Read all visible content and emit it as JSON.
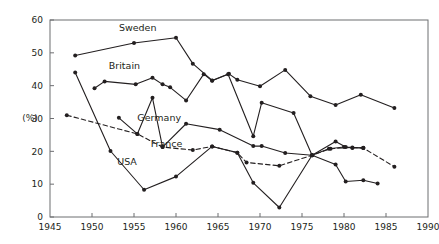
{
  "chart_data": {
    "type": "line",
    "title": "",
    "xlabel": "",
    "ylabel": "(%)",
    "xlim": [
      1945,
      1990
    ],
    "ylim": [
      0,
      60
    ],
    "xticks": [
      1945,
      1950,
      1955,
      1960,
      1965,
      1970,
      1975,
      1980,
      1985,
      1990
    ],
    "yticks": [
      0,
      10,
      20,
      30,
      40,
      50,
      60
    ],
    "grid": false,
    "legend": "inline-labels",
    "series": [
      {
        "name": "Sweden",
        "style": "solid",
        "label_x": 1953.2,
        "label_y": 56.5,
        "points": [
          [
            1948,
            49.2
          ],
          [
            1955,
            53.0
          ],
          [
            1960,
            54.6
          ],
          [
            1962,
            46.7
          ],
          [
            1964.3,
            41.6
          ],
          [
            1966.3,
            43.6
          ],
          [
            1967.3,
            41.8
          ],
          [
            1970,
            39.8
          ],
          [
            1973,
            44.8
          ],
          [
            1976,
            36.8
          ],
          [
            1979,
            34.1
          ],
          [
            1982,
            37.2
          ],
          [
            1986,
            33.2
          ]
        ]
      },
      {
        "name": "Britain",
        "style": "solid",
        "label_x": 1952.0,
        "label_y": 45.0,
        "points": [
          [
            1950.3,
            39.2
          ],
          [
            1951.5,
            41.3
          ],
          [
            1955.2,
            40.4
          ],
          [
            1957.2,
            42.4
          ],
          [
            1958.4,
            40.4
          ],
          [
            1959.3,
            39.5
          ],
          [
            1961.2,
            35.5
          ],
          [
            1963.3,
            43.5
          ],
          [
            1964.3,
            41.5
          ],
          [
            1966.2,
            43.5
          ],
          [
            1969.2,
            24.6
          ],
          [
            1970.2,
            34.8
          ],
          [
            1974,
            31.7
          ],
          [
            1976.2,
            18.8
          ],
          [
            1978.2,
            20.8
          ],
          [
            1980,
            21.3
          ],
          [
            1981,
            21.0
          ],
          [
            1982.3,
            21.1
          ]
        ]
      },
      {
        "name": "Germany",
        "style": "solid",
        "label_x": 1955.4,
        "label_y": 29.2,
        "points": [
          [
            1953.2,
            30.2
          ],
          [
            1955.4,
            25.3
          ],
          [
            1957.2,
            36.3
          ],
          [
            1958.4,
            21.3
          ],
          [
            1961.2,
            28.4
          ],
          [
            1965.2,
            26.6
          ],
          [
            1969.2,
            21.6
          ],
          [
            1970.2,
            21.6
          ],
          [
            1973,
            19.5
          ],
          [
            1976.2,
            18.8
          ],
          [
            1979,
            23.0
          ],
          [
            1980.2,
            21.3
          ],
          [
            1982.3,
            21.0
          ]
        ]
      },
      {
        "name": "France",
        "style": "dashed",
        "label_x": 1957.0,
        "label_y": 21.3,
        "points": [
          [
            1947,
            31.0
          ],
          [
            1955.4,
            25.3
          ],
          [
            1958.4,
            21.3
          ],
          [
            1962,
            20.4
          ],
          [
            1964.3,
            21.5
          ],
          [
            1967.3,
            19.6
          ],
          [
            1968.4,
            16.6
          ],
          [
            1972.3,
            15.6
          ],
          [
            1976.2,
            18.8
          ],
          [
            1978.4,
            20.8
          ],
          [
            1981,
            21.2
          ],
          [
            1982.3,
            21.0
          ],
          [
            1986,
            15.3
          ]
        ]
      },
      {
        "name": "USA",
        "style": "solid",
        "label_x": 1953.0,
        "label_y": 15.8,
        "points": [
          [
            1948,
            44.0
          ],
          [
            1952.2,
            20.1
          ],
          [
            1956.2,
            8.3
          ],
          [
            1960,
            12.3
          ],
          [
            1964.3,
            21.5
          ],
          [
            1967.3,
            19.6
          ],
          [
            1969.2,
            10.4
          ],
          [
            1972.3,
            2.9
          ],
          [
            1976.2,
            18.8
          ],
          [
            1979,
            16.0
          ],
          [
            1980.2,
            10.8
          ],
          [
            1982.3,
            11.2
          ],
          [
            1984,
            10.2
          ]
        ]
      }
    ]
  }
}
